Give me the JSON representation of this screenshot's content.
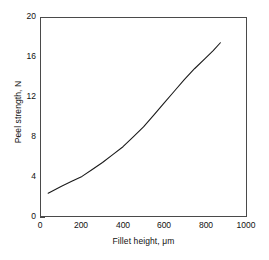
{
  "chart_data": {
    "type": "line",
    "title": "",
    "subtitle": "",
    "xlabel": "Fillet height, μm",
    "ylabel": "Peel strength, N",
    "xlim": [
      0,
      1000
    ],
    "ylim": [
      0,
      20
    ],
    "xticks": [
      0,
      200,
      400,
      600,
      800,
      1000
    ],
    "yticks": [
      0,
      4,
      8,
      12,
      16,
      20
    ],
    "xtick_labels": [
      "0",
      "200",
      "400",
      "600",
      "800",
      "1000"
    ],
    "ytick_labels": [
      "0",
      "4",
      "8",
      "12",
      "16",
      "20"
    ],
    "grid": false,
    "legend": false,
    "legend_position": "none",
    "line_color": "#1a1a1a",
    "line_width": 1.1,
    "axis_color": "#4a4a4a",
    "background_color": "#ffffff",
    "series": [
      {
        "name": "Peel strength vs fillet height",
        "x": [
          35,
          100,
          150,
          200,
          250,
          300,
          350,
          400,
          450,
          500,
          550,
          600,
          650,
          700,
          750,
          800,
          840,
          875
        ],
        "y": [
          2.3,
          3.0,
          3.5,
          4.0,
          4.7,
          5.4,
          6.2,
          7.0,
          8.0,
          9.0,
          10.2,
          11.4,
          12.6,
          13.8,
          14.9,
          15.9,
          16.7,
          17.5
        ]
      }
    ],
    "annotations": []
  },
  "figure": {
    "xaxis_title": "Fillet height, μm",
    "yaxis_title": "Peel strength, N"
  }
}
